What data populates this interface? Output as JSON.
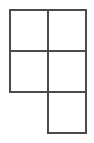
{
  "figure": {
    "name": "grid-polyomino-figure",
    "kind": "polyomino-outline-grid",
    "cell_count": 5,
    "background_color": "#ffffff",
    "line_color": "#4a4a4a",
    "line_width_px": 2,
    "grid": {
      "origin_x_px": 10,
      "origin_y_px": 10,
      "cell_width_px": 38,
      "cell_height_px": 41,
      "columns": 2,
      "rows": 3,
      "column_x_px": [
        10,
        48,
        86
      ],
      "row_y_px": [
        10,
        51,
        92,
        133
      ]
    },
    "cells": [
      {
        "name": "cell-top-left",
        "col": 0,
        "row": 0,
        "filled": true,
        "x": 10,
        "y": 10,
        "w": 38,
        "h": 41
      },
      {
        "name": "cell-top-right",
        "col": 1,
        "row": 0,
        "filled": true,
        "x": 48,
        "y": 10,
        "w": 38,
        "h": 41
      },
      {
        "name": "cell-middle-left",
        "col": 0,
        "row": 1,
        "filled": true,
        "x": 10,
        "y": 51,
        "w": 38,
        "h": 41
      },
      {
        "name": "cell-middle-right",
        "col": 1,
        "row": 1,
        "filled": true,
        "x": 48,
        "y": 51,
        "w": 38,
        "h": 41
      },
      {
        "name": "cell-bottom-left",
        "col": 0,
        "row": 2,
        "filled": false,
        "x": 10,
        "y": 92,
        "w": 38,
        "h": 41
      },
      {
        "name": "cell-bottom-right",
        "col": 1,
        "row": 2,
        "filled": true,
        "x": 48,
        "y": 92,
        "w": 38,
        "h": 41
      }
    ],
    "edges": [
      {
        "name": "edge-top",
        "x1": 10,
        "y1": 10,
        "x2": 86,
        "y2": 10
      },
      {
        "name": "edge-divider-horizontal-1",
        "x1": 10,
        "y1": 51,
        "x2": 86,
        "y2": 51
      },
      {
        "name": "edge-divider-horizontal-2",
        "x1": 10,
        "y1": 92,
        "x2": 86,
        "y2": 92
      },
      {
        "name": "edge-bottom",
        "x1": 48,
        "y1": 133,
        "x2": 86,
        "y2": 133
      },
      {
        "name": "edge-left-upper",
        "x1": 10,
        "y1": 10,
        "x2": 10,
        "y2": 92
      },
      {
        "name": "edge-divider-vertical",
        "x1": 48,
        "y1": 10,
        "x2": 48,
        "y2": 133
      },
      {
        "name": "edge-right",
        "x1": 86,
        "y1": 10,
        "x2": 86,
        "y2": 133
      }
    ]
  }
}
